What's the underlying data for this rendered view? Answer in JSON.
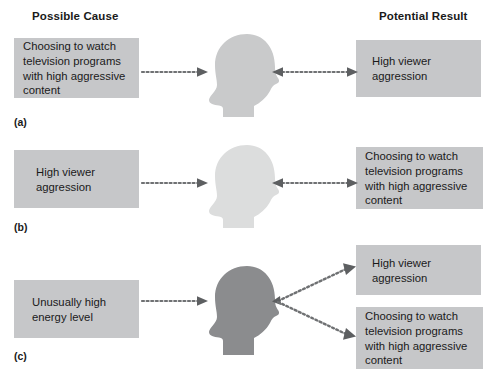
{
  "headers": {
    "cause": "Possible Cause",
    "result": "Potential Result"
  },
  "colors": {
    "box_fill": "#c6c7c9",
    "head_a": "#c9cacb",
    "head_b": "#dcdddd",
    "head_c": "#8b8c8e",
    "arrow": "#6f7173",
    "text": "#1a1a1a",
    "background": "#ffffff"
  },
  "panels": [
    {
      "label": "(a)",
      "head_tone": "light",
      "left_box": {
        "lines": [
          "Choosing to watch",
          "television programs",
          "with high aggressive",
          "content"
        ]
      },
      "right_boxes": [
        {
          "lines": [
            "High viewer",
            "aggression"
          ]
        }
      ],
      "arrows": [
        {
          "name": "arrow-cause-to-head",
          "direction": "right"
        },
        {
          "name": "arrow-result-to-head",
          "direction": "left"
        }
      ]
    },
    {
      "label": "(b)",
      "head_tone": "lightest",
      "left_box": {
        "lines": [
          "High viewer",
          "aggression"
        ]
      },
      "right_boxes": [
        {
          "lines": [
            "Choosing to watch",
            "television programs",
            "with high aggressive",
            "content"
          ]
        }
      ],
      "arrows": [
        {
          "name": "arrow-cause-to-head",
          "direction": "right"
        },
        {
          "name": "arrow-result-to-head",
          "direction": "left"
        }
      ]
    },
    {
      "label": "(c)",
      "head_tone": "dark",
      "left_box": {
        "lines": [
          "Unusually high",
          "energy level"
        ]
      },
      "right_boxes": [
        {
          "lines": [
            "High viewer",
            "aggression"
          ]
        },
        {
          "lines": [
            "Choosing to watch",
            "television programs",
            "with high aggressive",
            "content"
          ]
        }
      ],
      "arrows": [
        {
          "name": "arrow-cause-to-head",
          "direction": "right"
        },
        {
          "name": "arrow-head-to-result-top",
          "direction": "up-right"
        },
        {
          "name": "arrow-head-to-result-bottom",
          "direction": "down-right"
        }
      ]
    }
  ]
}
